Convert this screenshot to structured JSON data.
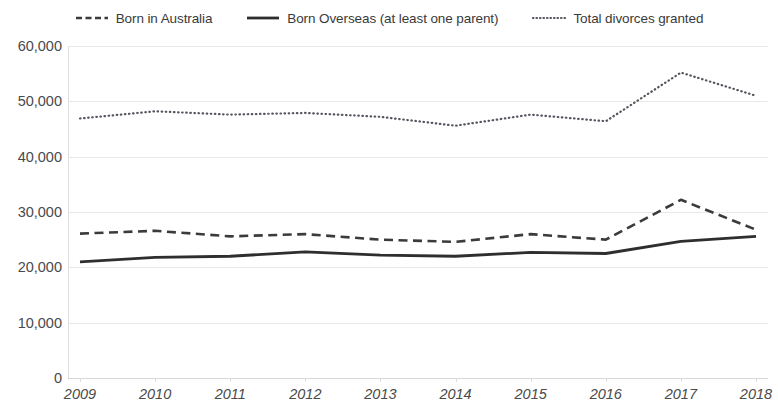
{
  "legend": {
    "position": "top-center",
    "items": [
      {
        "label": "Born in Australia",
        "style": "dashed",
        "color": "#3b3b3b",
        "name": "born-in-australia"
      },
      {
        "label": "Born Overseas (at least one parent)",
        "style": "solid",
        "color": "#2e2e2e",
        "name": "born-overseas"
      },
      {
        "label": "Total divorces granted",
        "style": "dotted",
        "color": "#55555f",
        "name": "total-divorces-granted"
      }
    ]
  },
  "axes": {
    "y_ticks": [
      "60,000",
      "50,000",
      "40,000",
      "30,000",
      "20,000",
      "10,000",
      "0"
    ],
    "x_ticks": [
      "2009",
      "2010",
      "2011",
      "2012",
      "2013",
      "2014",
      "2015",
      "2016",
      "2017",
      "2018"
    ]
  },
  "chart_data": {
    "type": "line",
    "title": "",
    "xlabel": "",
    "ylabel": "",
    "x": [
      2009,
      2010,
      2011,
      2012,
      2013,
      2014,
      2015,
      2016,
      2017,
      2018
    ],
    "categories": [
      "2009",
      "2010",
      "2011",
      "2012",
      "2013",
      "2014",
      "2015",
      "2016",
      "2017",
      "2018"
    ],
    "ylim": [
      0,
      60000
    ],
    "ytick_values": [
      0,
      10000,
      20000,
      30000,
      40000,
      50000,
      60000
    ],
    "grid": true,
    "legend_position": "top",
    "series": [
      {
        "name": "Born in Australia",
        "style": "dashed",
        "color": "#3b3b3b",
        "values": [
          26100,
          26600,
          25600,
          26000,
          25000,
          24600,
          26000,
          25000,
          32200,
          26800
        ]
      },
      {
        "name": "Born Overseas (at least one parent)",
        "style": "solid",
        "color": "#2e2e2e",
        "values": [
          21000,
          21800,
          22000,
          22800,
          22200,
          22000,
          22700,
          22500,
          24700,
          25600
        ]
      },
      {
        "name": "Total divorces granted",
        "style": "dotted",
        "color": "#55555f",
        "values": [
          46900,
          48200,
          47600,
          47900,
          47200,
          45600,
          47600,
          46400,
          55200,
          51000
        ]
      }
    ]
  }
}
